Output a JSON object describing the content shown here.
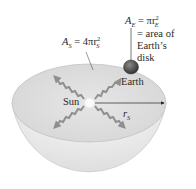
{
  "figure": {
    "sphere_area_label": {
      "var": "A",
      "sub": "S",
      "eq": " = 4πr",
      "sup": "2",
      "sub2": "S"
    },
    "earth_area_label": {
      "var": "A",
      "sub": "E",
      "eq": " = πr",
      "sup": "2",
      "sub2": "E"
    },
    "earth_area_desc": [
      "= area of",
      "Earth’s",
      "disk"
    ],
    "earth_label": "Earth",
    "sun_label": "Sun",
    "radius_label": {
      "var": "r",
      "sub": "S"
    }
  },
  "colors": {
    "bowl_outer": "#e9e9e9",
    "bowl_inner": "#dcdcdc",
    "rays": "#8f8f8f",
    "earth": "#5a5a5a",
    "text": "#2a2a2a"
  }
}
